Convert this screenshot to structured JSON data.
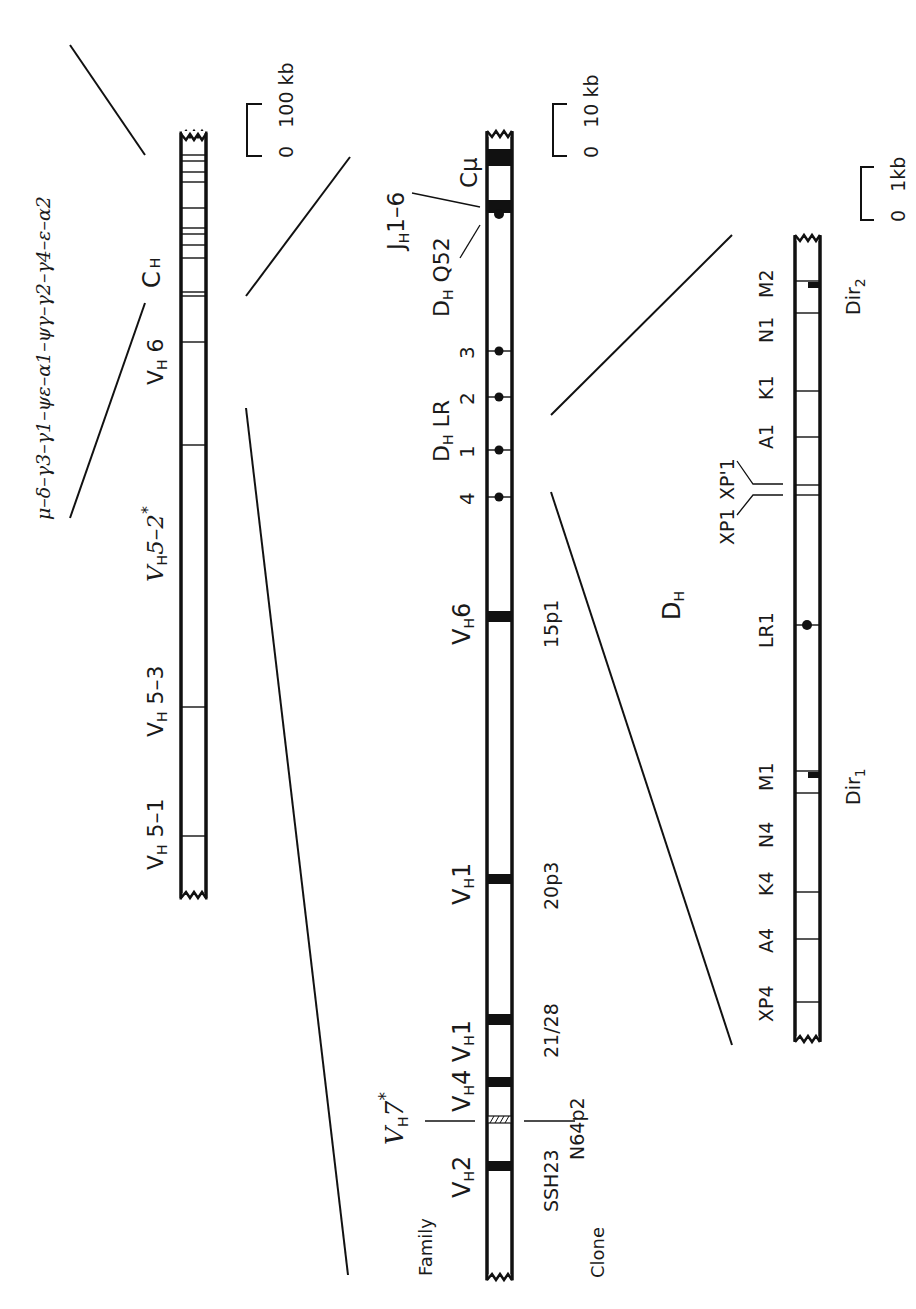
{
  "diagram": {
    "locus": {
      "constant_genes": "μ–δ–γ3–γ1–ψε–α1–ψγ–γ2–γ4–ε–α2",
      "constant_label": "C",
      "constant_sub": "H",
      "scale_label": "0   100 kb",
      "v_labels": [
        {
          "main": "V",
          "sub": "H",
          "rest": "5–2",
          "sup": "*",
          "italic": true
        },
        {
          "main": "V",
          "sub": "H",
          "rest": " 6",
          "italic": false
        },
        {
          "main": "V",
          "sub": "H",
          "rest": " 5–3",
          "italic": false
        },
        {
          "main": "V",
          "sub": "H",
          "rest": " 5–1",
          "italic": false
        }
      ]
    },
    "expanded": {
      "scale_label": "0   10 kb",
      "c_mu": "Cμ",
      "jh_label": {
        "main": "J",
        "sub": "H",
        "rest": "1–6"
      },
      "dq52_label": {
        "main": "D",
        "sub": "H",
        "rest": " Q52"
      },
      "dlr_label": {
        "main": "D",
        "sub": "H",
        "rest": " LR"
      },
      "dlr_numbers": [
        "3",
        "2",
        "1",
        "4"
      ],
      "family_header": "Family",
      "clone_header": "Clone",
      "genes": [
        {
          "family": "V_H6",
          "main": "V",
          "sub": "H",
          "rest": "6",
          "clone": "15p1"
        },
        {
          "family": "V_H1",
          "main": "V",
          "sub": "H",
          "rest": "1",
          "clone": "20p3"
        },
        {
          "family": "V_H4 V_H1",
          "main": "V",
          "sub": "H",
          "rest": "4 V",
          "sub2": "H",
          "rest2": "1",
          "clone": "21/28"
        },
        {
          "family": "V_H7*",
          "main": "V",
          "sub": "H",
          "rest": "7",
          "sup": "*",
          "clone": "N64p2"
        },
        {
          "family": "V_H2",
          "main": "V",
          "sub": "H",
          "rest": "2",
          "clone": "SSH23"
        }
      ]
    },
    "dh_region": {
      "scale_label": "0   1kb",
      "dh_label": {
        "main": "D",
        "sub": "H"
      },
      "segments": [
        "M2",
        "N1",
        "K1",
        "A1",
        "XP'1",
        "XP1",
        "LR1",
        "M1",
        "N4",
        "K4",
        "A4",
        "XP4"
      ],
      "dir2": {
        "main": "Dir",
        "sub": "2"
      },
      "dir1": {
        "main": "Dir",
        "sub": "1"
      }
    }
  }
}
